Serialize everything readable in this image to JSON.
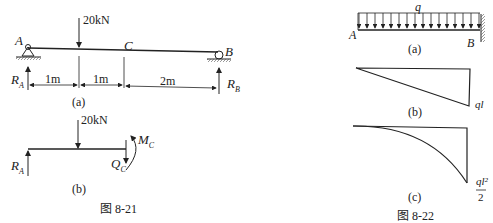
{
  "figure_8_21": {
    "caption": "图 8-21",
    "sub_a": {
      "caption": "(a)",
      "load": "20kN",
      "point_a": "A",
      "point_b": "B",
      "point_c": "C",
      "reaction_a": "R",
      "reaction_a_sub": "A",
      "reaction_b": "R",
      "reaction_b_sub": "B",
      "dims": [
        "1m",
        "1m",
        "2m"
      ]
    },
    "sub_b": {
      "caption": "(b)",
      "load": "20kN",
      "reaction_a": "R",
      "reaction_a_sub": "A",
      "moment": "M",
      "moment_sub": "C",
      "shear": "Q",
      "shear_sub": "C"
    }
  },
  "figure_8_22": {
    "caption": "图 8-22",
    "sub_a": {
      "caption": "(a)",
      "load": "q",
      "point_a": "A",
      "point_b": "B"
    },
    "sub_b": {
      "caption": "(b)",
      "value": "ql"
    },
    "sub_c": {
      "caption": "(c)",
      "value_num": "ql²",
      "value_den": "2"
    }
  }
}
